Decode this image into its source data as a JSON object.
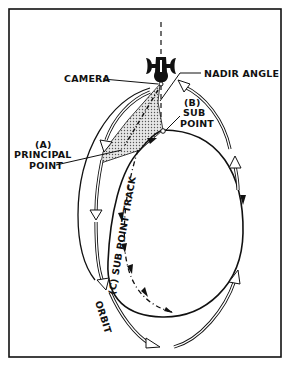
{
  "diagram": {
    "labels": {
      "camera": "CAMERA",
      "nadir_angle": "NADIR ANGLE",
      "sub_point_line1": "(B)",
      "sub_point_line2": "SUB",
      "sub_point_line3": "POINT",
      "principal_point_line1": "(A)",
      "principal_point_line2": "PRINCIPAL",
      "principal_point_line3": "POINT",
      "sub_point_track": "(C) SUB POINT TRACK",
      "orbit": "ORBIT"
    },
    "colors": {
      "ink": "#111111",
      "background": "#ffffff",
      "shade": "#bdbdbd"
    }
  }
}
